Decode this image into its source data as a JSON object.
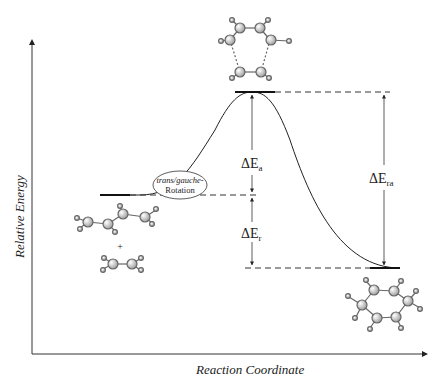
{
  "diagram": {
    "type": "reaction-energy-profile",
    "axes": {
      "y_label": "Relative Energy",
      "x_label": "Reaction Coordinate"
    },
    "annotations": {
      "rotation_label_italic": "trans/gauche-",
      "rotation_label": "Rotation",
      "delta_symbol": "Δ",
      "activation": {
        "base": "E",
        "sub": "a"
      },
      "reaction": {
        "base": "E",
        "sub": "r"
      },
      "reverse_activation": {
        "base": "E",
        "sub": "ra"
      },
      "plus": "+"
    },
    "levels": {
      "reactants": "butadiene + ethylene",
      "transition_state": "cyclic TS",
      "product": "cyclohexene"
    },
    "colors": {
      "line": "#222222",
      "atom_fill": "#e8e8e8",
      "atom_stroke": "#555555"
    }
  }
}
